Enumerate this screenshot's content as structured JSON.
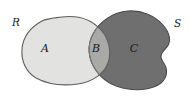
{
  "diagram": {
    "type": "venn-diagram",
    "background_color": "#ffffff",
    "outline_color": "#5a5a5a",
    "set_labels": [
      {
        "name": "R",
        "text": "R",
        "position": "outside-upper-left"
      },
      {
        "name": "S",
        "text": "S",
        "position": "outside-upper-right"
      }
    ],
    "regions": [
      {
        "name": "A",
        "text": "A",
        "description": "left set only",
        "fill_color": "#e2e2e0"
      },
      {
        "name": "B",
        "text": "B",
        "description": "intersection of both sets",
        "fill_color": "#a9a9a6"
      },
      {
        "name": "C",
        "text": "C",
        "description": "right set only",
        "fill_color": "#6f6f6f"
      }
    ]
  }
}
